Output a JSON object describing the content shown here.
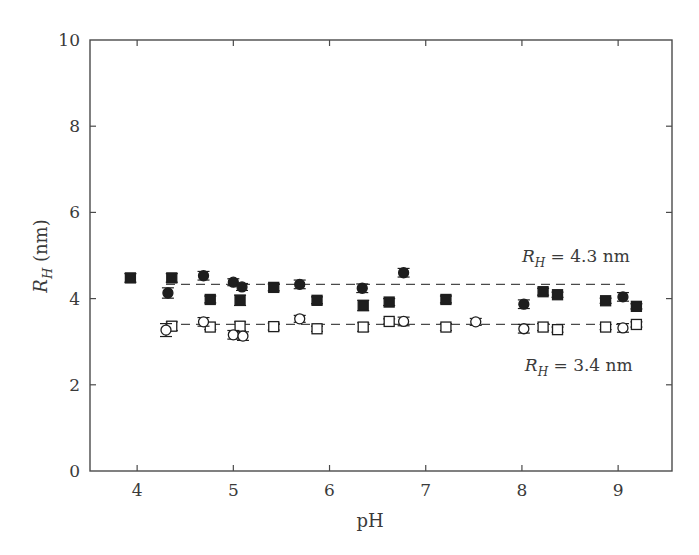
{
  "chart_data": {
    "type": "scatter",
    "title": "",
    "xlabel": "pH",
    "ylabel": "R_H (nm)",
    "ylabel_parts": {
      "main": "R",
      "sub": "H",
      "unit": " (nm)"
    },
    "xlim": [
      3.51,
      9.56
    ],
    "ylim": [
      0,
      10
    ],
    "xticks": [
      4,
      5,
      6,
      7,
      8,
      9
    ],
    "yticks": [
      0,
      2,
      4,
      6,
      8,
      10
    ],
    "grid": false,
    "legend": null,
    "series": [
      {
        "name": "filled squares",
        "marker": "square",
        "filled": true,
        "points": [
          {
            "x": 3.93,
            "y": 4.48,
            "err": 0.1
          },
          {
            "x": 4.36,
            "y": 4.48,
            "err": 0.1
          },
          {
            "x": 4.76,
            "y": 3.98,
            "err": 0.08
          },
          {
            "x": 5.07,
            "y": 3.96,
            "err": 0.12
          },
          {
            "x": 5.42,
            "y": 4.26,
            "err": 0.08
          },
          {
            "x": 5.87,
            "y": 3.96,
            "err": 0.08
          },
          {
            "x": 6.35,
            "y": 3.84,
            "err": 0.12
          },
          {
            "x": 6.62,
            "y": 3.92,
            "err": 0.08
          },
          {
            "x": 7.21,
            "y": 3.98,
            "err": 0.08
          },
          {
            "x": 8.22,
            "y": 4.16,
            "err": 0.08
          },
          {
            "x": 8.37,
            "y": 4.09,
            "err": 0.06
          },
          {
            "x": 8.87,
            "y": 3.95,
            "err": 0.06
          },
          {
            "x": 9.19,
            "y": 3.82,
            "err": 0.06
          }
        ]
      },
      {
        "name": "filled circles",
        "marker": "circle",
        "filled": true,
        "points": [
          {
            "x": 4.32,
            "y": 4.13,
            "err": 0.12
          },
          {
            "x": 4.69,
            "y": 4.53,
            "err": 0.1
          },
          {
            "x": 5.0,
            "y": 4.38,
            "err": 0.08
          },
          {
            "x": 5.09,
            "y": 4.27,
            "err": 0.08
          },
          {
            "x": 5.69,
            "y": 4.33,
            "err": 0.1
          },
          {
            "x": 6.34,
            "y": 4.24,
            "err": 0.1
          },
          {
            "x": 6.77,
            "y": 4.6,
            "err": 0.1
          },
          {
            "x": 8.02,
            "y": 3.87,
            "err": 0.1
          },
          {
            "x": 9.05,
            "y": 4.04,
            "err": 0.1
          }
        ]
      },
      {
        "name": "open squares",
        "marker": "square",
        "filled": false,
        "points": [
          {
            "x": 4.36,
            "y": 3.36,
            "err": 0.1
          },
          {
            "x": 4.76,
            "y": 3.34,
            "err": 0.06
          },
          {
            "x": 5.07,
            "y": 3.36,
            "err": 0.1
          },
          {
            "x": 5.42,
            "y": 3.35,
            "err": 0.08
          },
          {
            "x": 5.87,
            "y": 3.3,
            "err": 0.06
          },
          {
            "x": 6.35,
            "y": 3.34,
            "err": 0.1
          },
          {
            "x": 6.62,
            "y": 3.47,
            "err": 0.06
          },
          {
            "x": 7.21,
            "y": 3.34,
            "err": 0.08
          },
          {
            "x": 8.22,
            "y": 3.34,
            "err": 0.08
          },
          {
            "x": 8.37,
            "y": 3.28,
            "err": 0.06
          },
          {
            "x": 8.87,
            "y": 3.34,
            "err": 0.06
          },
          {
            "x": 9.19,
            "y": 3.4,
            "err": 0.06
          }
        ]
      },
      {
        "name": "open circles",
        "marker": "circle",
        "filled": false,
        "points": [
          {
            "x": 4.3,
            "y": 3.27,
            "err": 0.15
          },
          {
            "x": 4.69,
            "y": 3.46,
            "err": 0.1
          },
          {
            "x": 5.0,
            "y": 3.16,
            "err": 0.1
          },
          {
            "x": 5.1,
            "y": 3.13,
            "err": 0.1
          },
          {
            "x": 5.69,
            "y": 3.53,
            "err": 0.08
          },
          {
            "x": 6.77,
            "y": 3.47,
            "err": 0.1
          },
          {
            "x": 7.52,
            "y": 3.46,
            "err": 0.08
          },
          {
            "x": 8.02,
            "y": 3.3,
            "err": 0.1
          },
          {
            "x": 9.05,
            "y": 3.32,
            "err": 0.1
          }
        ]
      }
    ],
    "fit_lines": [
      {
        "name": "R_H = 4.3 nm",
        "y": 4.33,
        "x_start": 4.3,
        "x_end": 9.07,
        "style": "dashed"
      },
      {
        "name": "R_H = 3.4 nm",
        "y": 3.4,
        "x_start": 4.3,
        "x_end": 9.07,
        "style": "dashed"
      }
    ],
    "annotations": [
      {
        "text_main": "R",
        "text_sub": "H",
        "text_rest": " = 4.3 nm",
        "x": 8.0,
        "y": 4.98
      },
      {
        "text_main": "R",
        "text_sub": "H",
        "text_rest": " = 3.4 nm",
        "x": 8.03,
        "y": 2.45
      }
    ]
  },
  "colors": {
    "axis": "#4a4a4a",
    "marker": "#1e1e1e",
    "text": "#3a3a3a"
  }
}
